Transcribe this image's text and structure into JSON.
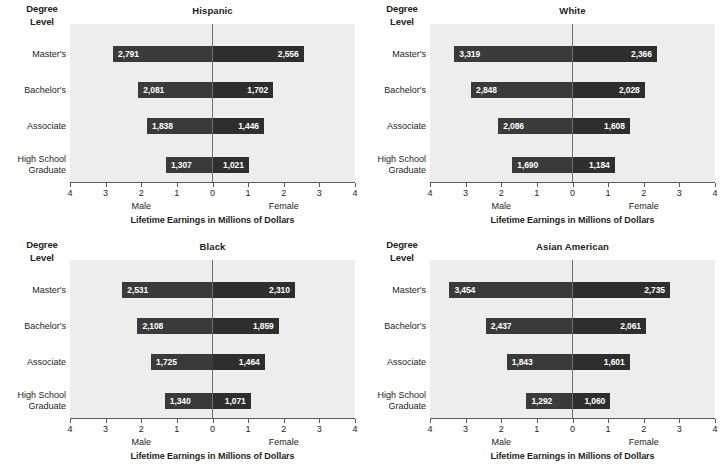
{
  "figure": {
    "degree_level_header_line1": "Degree",
    "degree_level_header_line2": "Level",
    "x_axis_title": "Lifetime Earnings in Millions of Dollars",
    "left_group_label": "Male",
    "right_group_label": "Female",
    "tick_labels": [
      "4",
      "3",
      "2",
      "1",
      "0",
      "1",
      "2",
      "3",
      "4"
    ],
    "categories": [
      "Master's",
      "Bachelor's",
      "Associate",
      "High School Graduate"
    ],
    "category_lines": [
      [
        "Master's"
      ],
      [
        "Bachelor's"
      ],
      [
        "Associate"
      ],
      [
        "High School",
        "Graduate"
      ]
    ],
    "colors": {
      "plot_background": "#ededed",
      "bar_male": "#3a3a3a",
      "bar_female": "#2e2e2e",
      "axis": "#58595b",
      "value_text": "#ffffff",
      "text": "#231f20"
    }
  },
  "chart_data": [
    {
      "type": "bar",
      "title": "Hispanic",
      "subtitle": "",
      "xlabel": "Lifetime Earnings in Millions of Dollars",
      "ylabel": "Degree Level",
      "orientation": "horizontal-diverging",
      "xlim": [
        -4,
        4
      ],
      "xticks": [
        -4,
        -3,
        -2,
        -1,
        0,
        1,
        2,
        3,
        4
      ],
      "xtick_labels": [
        "4",
        "3",
        "2",
        "1",
        "0",
        "1",
        "2",
        "3",
        "4"
      ],
      "grid": false,
      "legend": "none",
      "categories": [
        "Master's",
        "Bachelor's",
        "Associate",
        "High School Graduate"
      ],
      "series": [
        {
          "name": "Male",
          "direction": "left",
          "values": [
            2.791,
            2.081,
            1.838,
            1.307
          ],
          "labels": [
            "2,791",
            "2,081",
            "1,838",
            "1,307"
          ]
        },
        {
          "name": "Female",
          "direction": "right",
          "values": [
            2.556,
            1.702,
            1.446,
            1.021
          ],
          "labels": [
            "2,556",
            "1,702",
            "1,446",
            "1,021"
          ]
        }
      ]
    },
    {
      "type": "bar",
      "title": "White",
      "subtitle": "",
      "xlabel": "Lifetime Earnings in Millions of Dollars",
      "ylabel": "Degree Level",
      "orientation": "horizontal-diverging",
      "xlim": [
        -4,
        4
      ],
      "xticks": [
        -4,
        -3,
        -2,
        -1,
        0,
        1,
        2,
        3,
        4
      ],
      "xtick_labels": [
        "4",
        "3",
        "2",
        "1",
        "0",
        "1",
        "2",
        "3",
        "4"
      ],
      "grid": false,
      "legend": "none",
      "categories": [
        "Master's",
        "Bachelor's",
        "Associate",
        "High School Graduate"
      ],
      "series": [
        {
          "name": "Male",
          "direction": "left",
          "values": [
            3.319,
            2.848,
            2.086,
            1.69
          ],
          "labels": [
            "3,319",
            "2,848",
            "2,086",
            "1,690"
          ]
        },
        {
          "name": "Female",
          "direction": "right",
          "values": [
            2.366,
            2.028,
            1.608,
            1.184
          ],
          "labels": [
            "2,366",
            "2,028",
            "1,608",
            "1,184"
          ]
        }
      ]
    },
    {
      "type": "bar",
      "title": "Black",
      "subtitle": "",
      "xlabel": "Lifetime Earnings in Millions of Dollars",
      "ylabel": "Degree Level",
      "orientation": "horizontal-diverging",
      "xlim": [
        -4,
        4
      ],
      "xticks": [
        -4,
        -3,
        -2,
        -1,
        0,
        1,
        2,
        3,
        4
      ],
      "xtick_labels": [
        "4",
        "3",
        "2",
        "1",
        "0",
        "1",
        "2",
        "3",
        "4"
      ],
      "grid": false,
      "legend": "none",
      "categories": [
        "Master's",
        "Bachelor's",
        "Associate",
        "High School Graduate"
      ],
      "series": [
        {
          "name": "Male",
          "direction": "left",
          "values": [
            2.531,
            2.108,
            1.725,
            1.34
          ],
          "labels": [
            "2,531",
            "2,108",
            "1,725",
            "1,340"
          ]
        },
        {
          "name": "Female",
          "direction": "right",
          "values": [
            2.31,
            1.859,
            1.464,
            1.071
          ],
          "labels": [
            "2,310",
            "1,859",
            "1,464",
            "1,071"
          ]
        }
      ]
    },
    {
      "type": "bar",
      "title": "Asian American",
      "subtitle": "",
      "xlabel": "Lifetime Earnings in Millions of Dollars",
      "ylabel": "Degree Level",
      "orientation": "horizontal-diverging",
      "xlim": [
        -4,
        4
      ],
      "xticks": [
        -4,
        -3,
        -2,
        -1,
        0,
        1,
        2,
        3,
        4
      ],
      "xtick_labels": [
        "4",
        "3",
        "2",
        "1",
        "0",
        "1",
        "2",
        "3",
        "4"
      ],
      "grid": false,
      "legend": "none",
      "categories": [
        "Master's",
        "Bachelor's",
        "Associate",
        "High School Graduate"
      ],
      "series": [
        {
          "name": "Male",
          "direction": "left",
          "values": [
            3.454,
            2.437,
            1.843,
            1.292
          ],
          "labels": [
            "3,454",
            "2,437",
            "1,843",
            "1,292"
          ]
        },
        {
          "name": "Female",
          "direction": "right",
          "values": [
            2.735,
            2.061,
            1.601,
            1.06
          ],
          "labels": [
            "2,735",
            "2,061",
            "1,601",
            "1,060"
          ]
        }
      ]
    }
  ]
}
